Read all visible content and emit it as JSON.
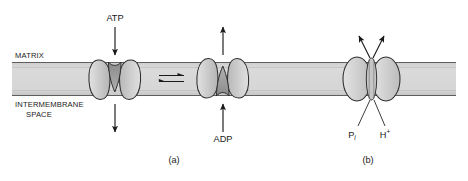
{
  "figure": {
    "compartments": {
      "top_label": "MATRIX",
      "bottom_label_line1": "INTERMEMBRANE",
      "bottom_label_line2": "SPACE"
    },
    "panels": [
      {
        "id": "a",
        "label": "(a)",
        "description": "ATP/ADP translocase in two conformations linked by an equilibrium arrow",
        "molecules": [
          {
            "name": "ATP",
            "label": "ATP",
            "direction": "into-matrix-downward"
          },
          {
            "name": "ADP",
            "label": "ADP",
            "direction": "into-matrix-upward"
          }
        ],
        "equilibrium_symbol": "reversible-double-half-arrow"
      },
      {
        "id": "b",
        "label": "(b)",
        "description": "Phosphate translocase co-transporting inorganic phosphate and protons upward into the matrix",
        "molecules": [
          {
            "name": "Pi",
            "label": "P",
            "subscript": "i",
            "direction": "into-matrix-upward"
          },
          {
            "name": "H-plus",
            "label": "H",
            "superscript": "+",
            "direction": "into-matrix-upward"
          }
        ]
      }
    ],
    "colors": {
      "background": "#ffffff",
      "membrane_fill": "#d6d6d6",
      "membrane_edge": "#8c8c8c",
      "membrane_border_line": "#5a5a5a",
      "protein_fill": "#c9c9c9",
      "protein_fill_light": "#dcdcdc",
      "protein_cavity": "#949494",
      "protein_outline": "#2e2e2e",
      "arrow": "#1a1a1a",
      "text": "#1a1a1a"
    }
  }
}
